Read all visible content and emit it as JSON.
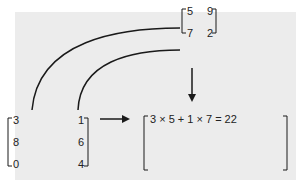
{
  "matrix_b": {
    "rows": [
      [
        "5",
        "9"
      ],
      [
        "7",
        "2"
      ]
    ]
  },
  "matrix_a": {
    "rows": [
      [
        "3",
        "1"
      ],
      [
        "8",
        "6"
      ],
      [
        "0",
        "4"
      ]
    ]
  },
  "result": {
    "first_entry": "3 × 5 + 1 × 7 = 22"
  },
  "colors": {
    "background": "#ececec",
    "line": "#1a1a1a"
  }
}
